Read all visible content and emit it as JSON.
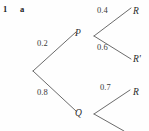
{
  "question": {
    "number": "1",
    "part": "a"
  },
  "diagram": {
    "type": "probability-tree",
    "stroke_color": "#5a5a5a",
    "background_color": "#fefefe",
    "nodes": [
      {
        "id": "root",
        "label": "",
        "x": 33,
        "y": 71
      },
      {
        "id": "P",
        "label": "P",
        "x": 80,
        "y": 34
      },
      {
        "id": "Q",
        "label": "Q",
        "x": 80,
        "y": 114
      },
      {
        "id": "R1",
        "label": "R",
        "x": 137,
        "y": 12
      },
      {
        "id": "R1p",
        "label": "R'",
        "x": 137,
        "y": 61
      },
      {
        "id": "R2",
        "label": "R",
        "x": 137,
        "y": 94
      },
      {
        "id": "R2p",
        "label": "",
        "x": 137,
        "y": 133
      }
    ],
    "branches": [
      {
        "from": "root",
        "to": "P",
        "probability": "0.2",
        "label_x": 46,
        "label_y": 44
      },
      {
        "from": "root",
        "to": "Q",
        "probability": "0.8",
        "label_x": 46,
        "label_y": 93
      },
      {
        "from": "P",
        "to": "R1",
        "probability": "0.4",
        "label_x": 102,
        "label_y": 11
      },
      {
        "from": "P",
        "to": "R1p",
        "probability": "0.6",
        "label_x": 102,
        "label_y": 48
      },
      {
        "from": "Q",
        "to": "R2",
        "probability": "0.7",
        "label_x": 104,
        "label_y": 88
      },
      {
        "from": "Q",
        "to": "R2p",
        "probability": "",
        "label_x": 104,
        "label_y": 126
      }
    ]
  }
}
